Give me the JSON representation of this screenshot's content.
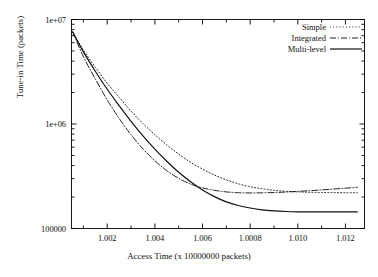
{
  "chart_data": {
    "type": "line",
    "title": "",
    "xlabel": "Access Time (x 10000000 packets)",
    "ylabel": "Tune-in Time (packets)",
    "yscale": "log",
    "ylim": [
      100000,
      10000000
    ],
    "xlim": [
      1.0005,
      1.0128
    ],
    "grid": false,
    "legend_position": "top-right",
    "ytick_labels": [
      "1e+07",
      "1e+06",
      "100000"
    ],
    "ytick_values": [
      10000000,
      1000000,
      100000
    ],
    "xtick_labels": [
      "1.002",
      "1.004",
      "1.006",
      "1.0008",
      "1.010",
      "1.012"
    ],
    "xtick_values": [
      1.002,
      1.004,
      1.006,
      1.008,
      1.01,
      1.012
    ],
    "series": [
      {
        "name": "Simple",
        "style": "dotted",
        "color": "#222222",
        "x": [
          1.00055,
          1.001,
          1.0015,
          1.002,
          1.0025,
          1.003,
          1.0035,
          1.004,
          1.0045,
          1.005,
          1.0055,
          1.006,
          1.0065,
          1.007,
          1.0075,
          1.008,
          1.0085,
          1.009,
          1.0095,
          1.01,
          1.0105,
          1.011,
          1.0115,
          1.012,
          1.0125
        ],
        "y": [
          7600000,
          5100000,
          3500000,
          2450000,
          1800000,
          1330000,
          1010000,
          790000,
          630000,
          515000,
          430000,
          370000,
          325000,
          292000,
          268000,
          251000,
          240000,
          232000,
          227000,
          224000,
          222000,
          221000,
          220500,
          220000,
          220000
        ]
      },
      {
        "name": "Integrated",
        "style": "dashdot",
        "color": "#222222",
        "x": [
          1.00055,
          1.001,
          1.0015,
          1.002,
          1.0025,
          1.003,
          1.0035,
          1.004,
          1.0045,
          1.005,
          1.0055,
          1.006,
          1.0065,
          1.007,
          1.0075,
          1.008,
          1.0085,
          1.009,
          1.0095,
          1.01,
          1.0105,
          1.011,
          1.0115,
          1.012,
          1.0125
        ],
        "y": [
          7600000,
          4400000,
          2700000,
          1700000,
          1130000,
          790000,
          578000,
          445000,
          358000,
          302000,
          266000,
          245000,
          232000,
          224000,
          220000,
          219000,
          219500,
          221000,
          223500,
          226500,
          230000,
          234000,
          238500,
          243000,
          248000
        ]
      },
      {
        "name": "Multi-level",
        "style": "solid",
        "color": "#111111",
        "x": [
          1.00055,
          1.001,
          1.0015,
          1.002,
          1.0025,
          1.003,
          1.0035,
          1.004,
          1.0045,
          1.005,
          1.0055,
          1.006,
          1.0065,
          1.007,
          1.0075,
          1.008,
          1.0085,
          1.009,
          1.0095,
          1.01,
          1.0105,
          1.011,
          1.0115,
          1.012,
          1.0125
        ],
        "y": [
          7600000,
          4900000,
          3200000,
          2150000,
          1500000,
          1060000,
          770000,
          575000,
          440000,
          345000,
          280000,
          234000,
          202000,
          180000,
          166000,
          157000,
          151000,
          147500,
          145500,
          144500,
          144000,
          144000,
          144000,
          144000,
          144000
        ]
      }
    ]
  },
  "legend": {
    "entries": [
      {
        "label": "Simple"
      },
      {
        "label": "Integrated"
      },
      {
        "label": "Multi-level"
      }
    ]
  }
}
